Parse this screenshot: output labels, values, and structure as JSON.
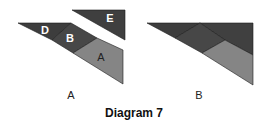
{
  "title": "Diagram 7",
  "colors": {
    "dark": "#3d3d3d",
    "mid": "#494949",
    "light": "#858585",
    "edge": "#1c1c1c",
    "piece_label": "#ffffff"
  },
  "diagram_a": {
    "caption": "A",
    "pieces": [
      {
        "id": "D",
        "label": "D"
      },
      {
        "id": "B",
        "label": "B"
      },
      {
        "id": "A",
        "label": "A"
      },
      {
        "id": "E",
        "label": "E"
      }
    ]
  },
  "diagram_b": {
    "caption": "B",
    "pieces": [
      {
        "id": "D"
      },
      {
        "id": "B"
      },
      {
        "id": "E"
      },
      {
        "id": "A"
      }
    ]
  }
}
